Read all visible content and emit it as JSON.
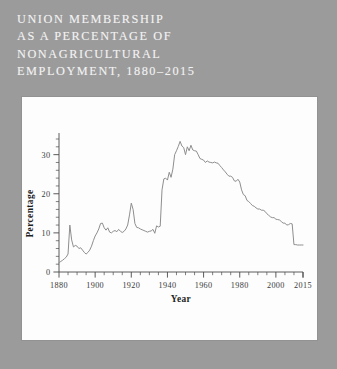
{
  "page": {
    "background_color": "#9b9b9b",
    "panel_color": "#fdfdfd"
  },
  "title": {
    "text": "UNION MEMBERSHIP\nAS A PERCENTAGE OF\nNONAGRICULTURAL\nEMPLOYMENT, 1880–2015",
    "color": "#f2f2f2"
  },
  "chart_data": {
    "type": "line",
    "title": "UNION MEMBERSHIP AS A PERCENTAGE OF NONAGRICULTURAL EMPLOYMENT, 1880–2015",
    "xlabel": "Year",
    "ylabel": "Percentage",
    "xlim": [
      1880,
      2015
    ],
    "ylim": [
      0,
      34
    ],
    "grid": false,
    "legend": false,
    "line_color": "#8e8e8e",
    "x_ticks_major": [
      1880,
      1900,
      1920,
      1940,
      1960,
      1980,
      2000,
      2015
    ],
    "x_tick_labels": [
      "1880",
      "1900",
      "1920",
      "1940",
      "1960",
      "1980",
      "2000",
      "2015"
    ],
    "x_ticks_minor_step": 5,
    "y_ticks_major": [
      0,
      10,
      20,
      30
    ],
    "y_tick_labels": [
      "0",
      "10",
      "20",
      "30"
    ],
    "y_ticks_minor_step": 2,
    "x": [
      1880,
      1881,
      1882,
      1883,
      1884,
      1885,
      1886,
      1887,
      1888,
      1889,
      1890,
      1891,
      1892,
      1893,
      1894,
      1895,
      1896,
      1897,
      1898,
      1899,
      1900,
      1901,
      1902,
      1903,
      1904,
      1905,
      1906,
      1907,
      1908,
      1909,
      1910,
      1911,
      1912,
      1913,
      1914,
      1915,
      1916,
      1917,
      1918,
      1919,
      1920,
      1921,
      1922,
      1923,
      1924,
      1925,
      1926,
      1927,
      1928,
      1929,
      1930,
      1931,
      1932,
      1933,
      1934,
      1935,
      1936,
      1937,
      1938,
      1939,
      1940,
      1941,
      1942,
      1943,
      1944,
      1945,
      1946,
      1947,
      1948,
      1949,
      1950,
      1951,
      1952,
      1953,
      1954,
      1955,
      1956,
      1957,
      1958,
      1959,
      1960,
      1961,
      1962,
      1963,
      1964,
      1965,
      1966,
      1967,
      1968,
      1969,
      1970,
      1971,
      1972,
      1973,
      1974,
      1975,
      1976,
      1977,
      1978,
      1979,
      1980,
      1981,
      1982,
      1983,
      1984,
      1985,
      1986,
      1987,
      1988,
      1989,
      1990,
      1991,
      1992,
      1993,
      1994,
      1995,
      1996,
      1997,
      1998,
      1999,
      2000,
      2001,
      2002,
      2003,
      2004,
      2005,
      2006,
      2007,
      2008,
      2009,
      2010,
      2011,
      2012,
      2013,
      2014,
      2015
    ],
    "values": [
      2.4,
      2.7,
      3.0,
      3.4,
      3.8,
      4.6,
      12.0,
      8.2,
      6.4,
      6.8,
      6.6,
      6.0,
      6.2,
      5.6,
      5.0,
      4.6,
      5.0,
      5.6,
      6.6,
      8.0,
      9.2,
      10.0,
      11.0,
      12.4,
      12.5,
      11.3,
      10.7,
      11.3,
      10.2,
      10.0,
      10.4,
      10.6,
      10.3,
      10.9,
      10.4,
      10.1,
      10.4,
      11.0,
      12.0,
      14.6,
      17.6,
      16.0,
      12.4,
      11.4,
      11.3,
      11.0,
      10.8,
      10.6,
      10.4,
      10.2,
      10.4,
      10.5,
      10.9,
      9.9,
      11.8,
      11.5,
      11.7,
      21.0,
      23.8,
      24.0,
      23.5,
      25.5,
      24.2,
      26.3,
      30.0,
      31.0,
      32.1,
      33.4,
      32.2,
      31.8,
      30.0,
      32.0,
      31.0,
      32.4,
      31.2,
      31.0,
      30.9,
      30.0,
      29.0,
      28.8,
      28.6,
      28.0,
      28.4,
      28.1,
      28.0,
      27.9,
      28.1,
      27.9,
      27.8,
      27.2,
      26.7,
      26.1,
      25.6,
      25.0,
      24.5,
      24.5,
      24.2,
      23.3,
      23.2,
      23.7,
      23.0,
      21.0,
      19.8,
      19.5,
      18.3,
      18.0,
      17.5,
      17.0,
      16.8,
      16.4,
      16.1,
      16.1,
      15.8,
      15.8,
      15.5,
      14.9,
      14.5,
      14.1,
      13.9,
      13.9,
      13.5,
      13.4,
      13.3,
      12.9,
      12.5,
      12.5,
      12.0,
      12.1,
      12.4,
      12.3,
      7.0,
      7.0,
      6.9,
      6.9,
      6.9,
      6.9
    ]
  }
}
